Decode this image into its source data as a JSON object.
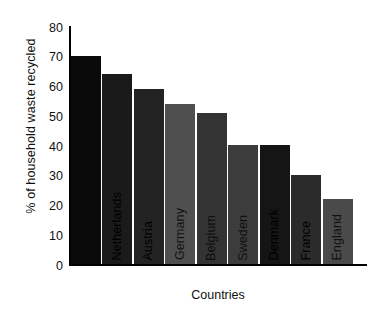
{
  "chart_data": {
    "type": "bar",
    "title": "",
    "xlabel": "Countries",
    "ylabel": "% of household waste recycled",
    "categories": [
      "Switzerland",
      "Netherlands",
      "Austria",
      "Germany",
      "Belgium",
      "Sweden",
      "Denmark",
      "France",
      "England"
    ],
    "values": [
      70,
      64,
      59,
      54,
      51,
      40,
      40,
      30,
      22
    ],
    "bar_colors": [
      "#0a0a0a",
      "#1a1a1a",
      "#232323",
      "#4f4f4f",
      "#333333",
      "#3c3c3c",
      "#151515",
      "#2b2b2b",
      "#4a4a4a"
    ],
    "label_colors": [
      "#0a0a0a",
      "#000000",
      "#000000",
      "#111111",
      "#0d0d0d",
      "#111111",
      "#000000",
      "#000000",
      "#111111"
    ],
    "ylim": [
      0,
      80
    ],
    "yticks": [
      0,
      10,
      20,
      30,
      40,
      50,
      60,
      70,
      80
    ],
    "ytick_labels": [
      "0",
      "10",
      "20",
      "30",
      "40",
      "50",
      "60",
      "70",
      "80"
    ],
    "grid": false,
    "legend": false,
    "legend_position": "none",
    "axis_color": "#000000",
    "background": "#ffffff"
  }
}
